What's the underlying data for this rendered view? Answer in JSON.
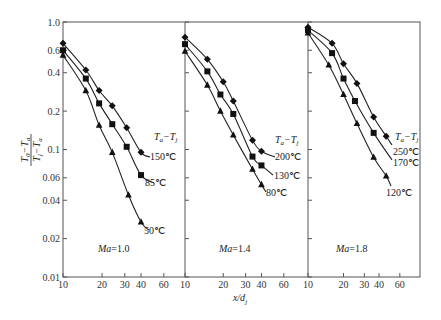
{
  "chart_data": {
    "type": "line",
    "title": "",
    "xlabel": "x/d_j",
    "ylabel": "(T_0 - T_a)/(T_j - T_a)",
    "yscale": "log",
    "xscale": "log",
    "ylim": [
      0.01,
      1.0
    ],
    "y_ticks": [
      1.0,
      0.6,
      0.4,
      0.2,
      0.1,
      0.06,
      0.04,
      0.02,
      0.01
    ],
    "y_tick_labels": [
      "1.0",
      "0.6",
      "0.4",
      "0.2",
      "0.1",
      "0.06",
      "0.04",
      "0.02",
      "0.01"
    ],
    "x_ticks": [
      10,
      20,
      30,
      40,
      60
    ],
    "x_tick_labels": [
      "10",
      "20",
      "30",
      "40",
      "60"
    ],
    "grid": false,
    "legend_title": "Ta−Tj",
    "panels": [
      {
        "label": "Ma=1.0",
        "xlim": [
          10,
          85
        ],
        "series": [
          {
            "name": "150℃",
            "marker": "diamond",
            "x": [
              10,
              15,
              19,
              24,
              31,
              40
            ],
            "y": [
              0.68,
              0.42,
              0.29,
              0.22,
              0.148,
              0.095
            ]
          },
          {
            "name": "85℃",
            "marker": "square",
            "x": [
              10,
              15,
              19,
              24,
              31,
              40
            ],
            "y": [
              0.6,
              0.36,
              0.23,
              0.158,
              0.105,
              0.063
            ]
          },
          {
            "name": "50℃",
            "marker": "triangle",
            "x": [
              10,
              15,
              19,
              24,
              32,
              40
            ],
            "y": [
              0.55,
              0.29,
              0.155,
              0.095,
              0.044,
              0.027
            ]
          }
        ]
      },
      {
        "label": "Ma=1.4",
        "xlim": [
          10,
          88
        ],
        "series": [
          {
            "name": "200℃",
            "marker": "diamond",
            "x": [
              10,
              15,
              20,
              24,
              34,
              40
            ],
            "y": [
              0.76,
              0.51,
              0.34,
              0.24,
              0.118,
              0.097
            ]
          },
          {
            "name": "130℃",
            "marker": "square",
            "x": [
              10,
              15,
              19,
              24,
              34,
              40
            ],
            "y": [
              0.67,
              0.41,
              0.27,
              0.19,
              0.088,
              0.075
            ]
          },
          {
            "name": "80℃",
            "marker": "triangle",
            "x": [
              10,
              15,
              19,
              24,
              34,
              40
            ],
            "y": [
              0.59,
              0.32,
              0.2,
              0.13,
              0.07,
              0.053
            ]
          }
        ]
      },
      {
        "label": "Ma=1.8",
        "xlim": [
          10,
          88
        ],
        "series": [
          {
            "name": "250℃",
            "marker": "diamond",
            "x": [
              10,
              16,
              20,
              26,
              36,
              46
            ],
            "y": [
              0.91,
              0.68,
              0.47,
              0.33,
              0.18,
              0.127
            ]
          },
          {
            "name": "170℃",
            "marker": "square",
            "x": [
              10,
              16,
              20,
              25,
              36
            ],
            "y": [
              0.86,
              0.57,
              0.36,
              0.24,
              0.135
            ]
          },
          {
            "name": "120℃",
            "marker": "triangle",
            "x": [
              10,
              15,
              20,
              26,
              36,
              46
            ],
            "y": [
              0.82,
              0.46,
              0.27,
              0.16,
              0.087,
              0.062
            ]
          }
        ]
      }
    ]
  },
  "axis": {
    "xlabel_main": "x/d",
    "xlabel_sub": "j",
    "ylabel_num_a": "T",
    "ylabel_num_a_sub": "0",
    "ylabel_num_b": "T",
    "ylabel_num_b_sub": "a",
    "ylabel_den_a": "T",
    "ylabel_den_a_sub": "j",
    "ylabel_den_b": "T",
    "ylabel_den_b_sub": "a"
  },
  "legend": {
    "title_a": "T",
    "title_a_sub": "a",
    "title_b": "T",
    "title_b_sub": "j"
  }
}
